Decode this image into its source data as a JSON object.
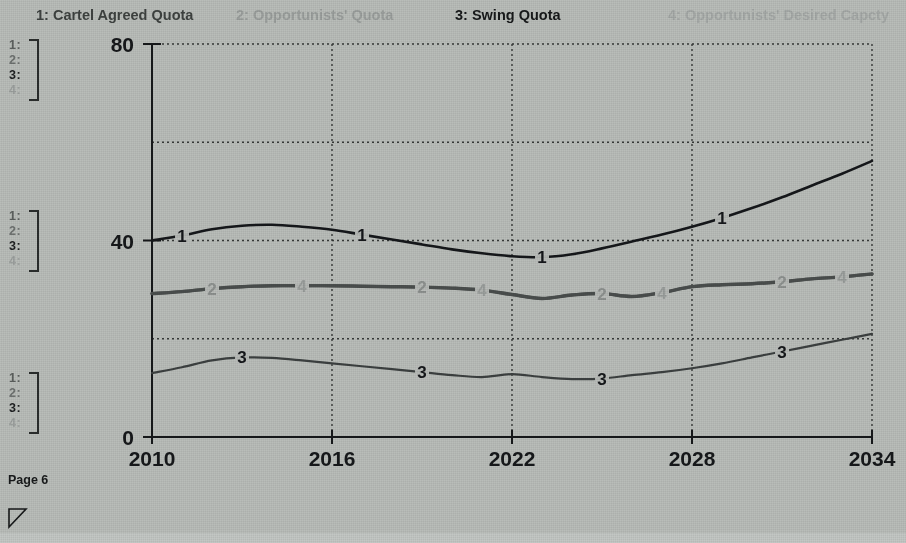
{
  "legend": {
    "items": [
      {
        "key": "1",
        "label": "1: Cartel Agreed Quota"
      },
      {
        "key": "2",
        "label": "2: Opportunists' Quota"
      },
      {
        "key": "3",
        "label": "3: Swing Quota"
      },
      {
        "key": "4",
        "label": "4: Opportunists' Desired Capcty"
      }
    ]
  },
  "key_blocks": {
    "rows": [
      "1:",
      "2:",
      "3:",
      "4:"
    ]
  },
  "footer": {
    "page_label": "Page 6",
    "resize_handle": "resize-handle-icon"
  },
  "axes": {
    "y_ticks": [
      "0",
      "40",
      "80"
    ],
    "x_ticks": [
      "2010",
      "2016",
      "2022",
      "2028",
      "2034"
    ],
    "x_title": "Years",
    "y_title": ""
  },
  "colors": {
    "background": "#b9bdb9",
    "series_1": "#15171a",
    "series_2": "#4a4e4d",
    "series_3": "#3c4040",
    "series_4": "#5d615f",
    "gridline": "#2b2e2d",
    "axis": "#16181a"
  },
  "chart_data": {
    "type": "line",
    "title": "",
    "xlabel": "Years",
    "ylabel": "",
    "xlim": [
      2010,
      2034
    ],
    "ylim": [
      0,
      80
    ],
    "grid": true,
    "legend_position": "top",
    "x": [
      2010,
      2011,
      2012,
      2013,
      2014,
      2015,
      2016,
      2017,
      2018,
      2019,
      2020,
      2021,
      2022,
      2023,
      2024,
      2025,
      2026,
      2027,
      2028,
      2029,
      2030,
      2031,
      2032,
      2033,
      2034
    ],
    "series": [
      {
        "name": "Cartel Agreed Quota",
        "key": "1",
        "label_positions": [
          2011,
          2017,
          2023,
          2029
        ],
        "values": [
          40.0,
          41.0,
          42.3,
          43.0,
          43.2,
          42.8,
          42.2,
          41.2,
          40.2,
          39.2,
          38.2,
          37.4,
          36.8,
          36.6,
          37.2,
          38.4,
          39.8,
          41.2,
          42.8,
          44.6,
          46.6,
          48.8,
          51.2,
          53.6,
          56.2
        ]
      },
      {
        "name": "Opportunists' Quota",
        "key": "2",
        "label_positions": [
          2012,
          2019,
          2025,
          2031
        ],
        "values": [
          29.2,
          29.6,
          30.2,
          30.6,
          30.8,
          30.8,
          30.8,
          30.7,
          30.6,
          30.5,
          30.3,
          29.9,
          29.0,
          28.2,
          28.9,
          29.2,
          28.6,
          29.4,
          30.6,
          31.0,
          31.2,
          31.6,
          32.2,
          32.6,
          33.2
        ]
      },
      {
        "name": "Swing Quota",
        "key": "3",
        "label_positions": [
          2013,
          2019,
          2025,
          2031
        ],
        "values": [
          13.0,
          14.2,
          15.6,
          16.2,
          16.1,
          15.6,
          15.0,
          14.4,
          13.8,
          13.2,
          12.6,
          12.2,
          12.8,
          12.2,
          11.8,
          11.9,
          12.6,
          13.2,
          14.0,
          15.0,
          16.2,
          17.4,
          18.6,
          19.8,
          21.0
        ]
      },
      {
        "name": "Opportunists' Desired Capcty",
        "key": "4",
        "label_positions": [
          2015,
          2021,
          2027,
          2033
        ],
        "values": [
          29.2,
          29.6,
          30.2,
          30.6,
          30.8,
          30.8,
          30.8,
          30.7,
          30.6,
          30.5,
          30.3,
          29.9,
          29.0,
          28.2,
          28.9,
          29.2,
          28.6,
          29.4,
          30.6,
          31.0,
          31.2,
          31.6,
          32.2,
          32.6,
          33.2
        ]
      }
    ]
  }
}
